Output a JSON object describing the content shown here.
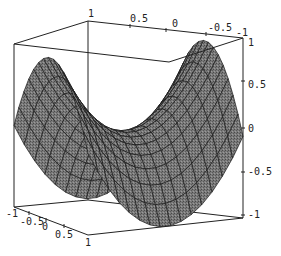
{
  "chart_data": {
    "type": "surface3d",
    "title": "",
    "function": "z = x^2 - y^2",
    "x_axis": {
      "label": "",
      "range": [
        -1,
        1
      ],
      "ticks": [
        "-1",
        "-0.5",
        "0",
        "0.5",
        "1"
      ]
    },
    "y_axis": {
      "label": "",
      "range": [
        -1,
        1
      ],
      "ticks": [
        "1",
        "0.5",
        "0",
        "-0.5",
        "-1"
      ]
    },
    "z_axis": {
      "label": "",
      "range": [
        -1,
        1
      ],
      "ticks": [
        "1",
        "0.5",
        "0",
        "-0.5",
        "-1"
      ]
    },
    "mesh": {
      "divisions": 15
    },
    "colors": {
      "surface": "#6e6e6e",
      "mesh": "#1a1a1a",
      "box": "#222222",
      "background": "#ffffff"
    },
    "grid": false,
    "legend": null
  },
  "labels": {
    "top_axis": [
      {
        "text": "1",
        "x": 88,
        "y": 17
      },
      {
        "text": "0.5",
        "x": 130,
        "y": 22
      },
      {
        "text": "0",
        "x": 172,
        "y": 27
      },
      {
        "text": "-0.5",
        "x": 208,
        "y": 31
      },
      {
        "text": "-1",
        "x": 236,
        "y": 36
      }
    ],
    "right_axis": [
      {
        "text": "1",
        "x": 248,
        "y": 46
      },
      {
        "text": "0.5",
        "x": 248,
        "y": 88
      },
      {
        "text": "0",
        "x": 248,
        "y": 132
      },
      {
        "text": "-0.5",
        "x": 248,
        "y": 175
      },
      {
        "text": "-1",
        "x": 248,
        "y": 218
      }
    ],
    "bottom_axis": [
      {
        "text": "-1",
        "x": 6,
        "y": 217
      },
      {
        "text": "-0.5",
        "x": 20,
        "y": 225
      },
      {
        "text": "0",
        "x": 42,
        "y": 230
      },
      {
        "text": "0.5",
        "x": 55,
        "y": 238
      },
      {
        "text": "1",
        "x": 85,
        "y": 246
      }
    ]
  }
}
